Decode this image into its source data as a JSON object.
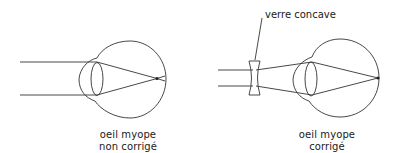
{
  "diagram": {
    "type": "optics-illustration",
    "colors": {
      "stroke": "#333333",
      "text": "#1a1a1a",
      "background": "#ffffff"
    },
    "panels": [
      {
        "id": "uncorrected",
        "caption_line1": "oeil myope",
        "caption_line2": "non corrigé",
        "elements": [
          "parallel-rays",
          "cornea",
          "crystalline-lens",
          "eyeball",
          "focal-point-before-retina"
        ]
      },
      {
        "id": "corrected",
        "caption_line1": "oeil myope",
        "caption_line2": "corrigé",
        "callout": "verre concave",
        "elements": [
          "parallel-rays",
          "concave-lens",
          "diverging-rays",
          "cornea",
          "crystalline-lens",
          "eyeball",
          "focal-point-on-retina"
        ]
      }
    ]
  }
}
